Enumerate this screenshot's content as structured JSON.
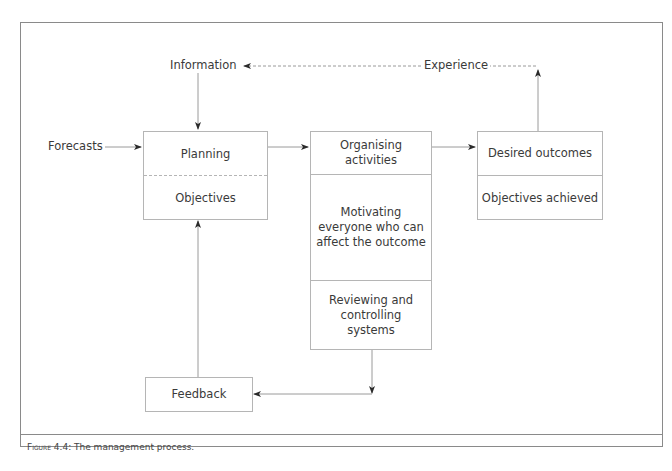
{
  "figure": {
    "caption_prefix": "Figure",
    "caption_rest": " 4.4: The management process."
  },
  "labels": {
    "information": "Information",
    "experience": "Experience",
    "forecasts": "Forecasts"
  },
  "boxes": {
    "planning": {
      "top": "Planning",
      "bottom": "Objectives"
    },
    "middle": {
      "top": "Organising activities",
      "middle": "Motivating everyone who can affect the outcome",
      "bottom": "Reviewing and controlling systems"
    },
    "outcomes": {
      "top": "Desired outcomes",
      "bottom": "Objectives achieved"
    },
    "feedback": "Feedback"
  },
  "colors": {
    "frame": "#8a8a8a",
    "box_border": "#b5b5b5",
    "line": "#9a9a9a",
    "arrowhead": "#2a2a2a",
    "text": "#3a3a3a"
  }
}
